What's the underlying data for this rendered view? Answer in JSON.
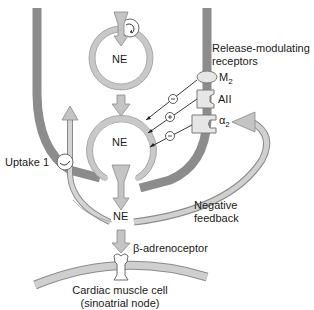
{
  "diagram": {
    "type": "adrenergic-synapse",
    "colors": {
      "nerve_terminal": "#8c8c8c",
      "membrane_fill": "#c8c8c8",
      "membrane_stroke": "#909090",
      "arrow_fill": "#c4c4c4",
      "arrow_stroke": "#8a8a8a",
      "text": "#1a1a1a",
      "background": "#ffffff"
    },
    "labels": {
      "vesicle_top": "NE",
      "vesicle_bottom": "NE",
      "synaptic_ne": "NE",
      "release_modulating_line1": "Release-modulating",
      "release_modulating_line2": "receptors",
      "receptor_m2": "M",
      "receptor_m2_sub": "2",
      "receptor_aii": "AII",
      "receptor_alpha2": "α",
      "receptor_alpha2_sub": "2",
      "uptake": "Uptake 1",
      "negative_feedback_line1": "Negative",
      "negative_feedback_line2": "feedback",
      "beta_receptor": "β-adrenoceptor",
      "cell_line1": "Cardiac muscle cell",
      "cell_line2": "(sinoatrial node)"
    },
    "receptor_signs": [
      {
        "receptor": "M2",
        "sign": "−"
      },
      {
        "receptor": "AII",
        "sign": "+"
      },
      {
        "receptor": "alpha2",
        "sign": "−"
      }
    ]
  }
}
